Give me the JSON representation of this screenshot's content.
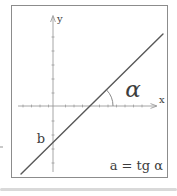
{
  "figure": {
    "y_axis_label": "y",
    "x_axis_label": "x",
    "intercept_label": "b",
    "angle_label": "α",
    "formula": "a = tg α",
    "colors": {
      "frame": "#8c8c8c",
      "axis": "#8f8f8f",
      "line": "#585858",
      "arc": "#7d7d7d",
      "text": "#3d3d3d",
      "background": "#ffffff",
      "divider": "#d9d9d9"
    }
  }
}
